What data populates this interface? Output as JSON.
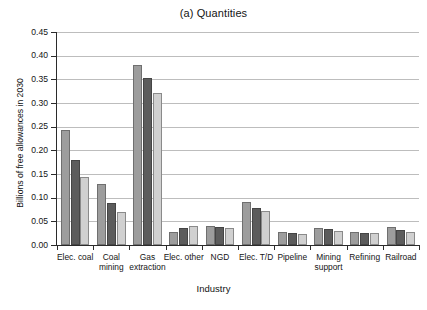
{
  "chart_data": {
    "type": "bar",
    "title": "(a) Quantities",
    "xlabel": "Industry",
    "ylabel": "Billions of free allowances in 2030",
    "ylim": [
      0,
      0.45
    ],
    "ytick_labels": [
      "0.00",
      "0.05",
      "0.10",
      "0.15",
      "0.20",
      "0.25",
      "0.30",
      "0.35",
      "0.40",
      "0.45"
    ],
    "ytick_values": [
      0,
      0.05,
      0.1,
      0.15,
      0.2,
      0.25,
      0.3,
      0.35,
      0.4,
      0.45
    ],
    "grid": true,
    "legend_position": "none",
    "categories": [
      "Elec. coal",
      "Coal mining",
      "Gas extraction",
      "Elec. other",
      "NGD",
      "Elec. T/D",
      "Pipeline",
      "Mining support",
      "Refining",
      "Railroad"
    ],
    "category_lines": [
      [
        "Elec. coal",
        ""
      ],
      [
        "Coal",
        "mining"
      ],
      [
        "Gas",
        "extraction"
      ],
      [
        "Elec. other",
        ""
      ],
      [
        "NGD",
        ""
      ],
      [
        "Elec. T/D",
        ""
      ],
      [
        "Pipeline",
        ""
      ],
      [
        "Mining",
        "support"
      ],
      [
        "Refining",
        ""
      ],
      [
        "Railroad",
        ""
      ]
    ],
    "series": [
      {
        "name": "series-1",
        "color": "#9d9d9d",
        "values": [
          0.244,
          0.129,
          0.38,
          0.027,
          0.04,
          0.091,
          0.028,
          0.036,
          0.027,
          0.038
        ]
      },
      {
        "name": "series-2",
        "color": "#5c5c5c",
        "values": [
          0.179,
          0.089,
          0.353,
          0.037,
          0.039,
          0.079,
          0.026,
          0.033,
          0.026,
          0.032
        ]
      },
      {
        "name": "series-3",
        "color": "#d0d0d0",
        "values": [
          0.143,
          0.07,
          0.322,
          0.04,
          0.036,
          0.071,
          0.023,
          0.03,
          0.025,
          0.028
        ]
      }
    ]
  }
}
